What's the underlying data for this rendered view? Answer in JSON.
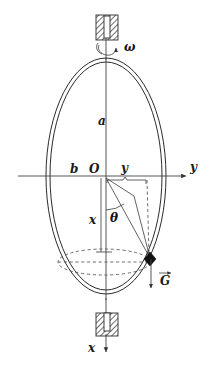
{
  "figure": {
    "background_color": "#ffffff",
    "line_color": "#2b2b2b",
    "width": 213,
    "height": 366
  },
  "labels": {
    "omega": "ω",
    "semi_major_a": "a",
    "semi_minor_b": "b",
    "origin": "O",
    "y_distance": "y",
    "y_axis": "y",
    "x_coordinate": "x",
    "theta": "θ",
    "gravity_vector": "G",
    "x_axis": "x"
  },
  "elements": {
    "top_bearing": "hatched-support-block",
    "bottom_bearing": "hatched-support-block",
    "rotation_arrow": "curved-spin-arrow",
    "hoop": "double-line-ellipse",
    "bead": "particle-dot",
    "bead_path": "dashed-circular-path",
    "brace": "horizontal-measure-brace",
    "radius_line": "origin-to-bead-line",
    "projection_line": "vertical-dashed-drop"
  },
  "geometry": {
    "center_x": 106,
    "center_y": 176,
    "hoop_rx_outer": 60,
    "hoop_ry_outer": 118,
    "hoop_rx_inner": 56,
    "hoop_ry_inner": 114,
    "bead_x": 150,
    "bead_y": 258,
    "path_rx": 46,
    "path_ry": 13,
    "path_cy": 262
  }
}
